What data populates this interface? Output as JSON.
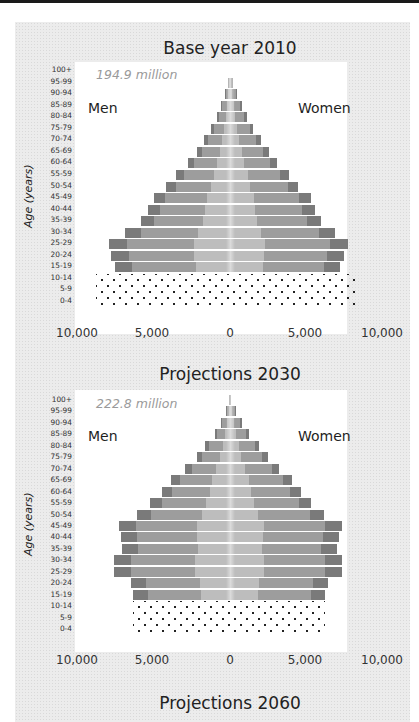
{
  "chart_data": [
    {
      "type": "bar",
      "subtype": "population-pyramid",
      "title": "Base year 2010",
      "annotation": "194.9 million",
      "xlabel": "",
      "ylabel": "Age (years)",
      "xlim": [
        -10000,
        10000
      ],
      "x_tick_labels": [
        "10,000",
        "5,000",
        "0",
        "5,000",
        "10,000"
      ],
      "legend": [
        "Men",
        "Women"
      ],
      "categories": [
        "100+",
        "95-99",
        "90-94",
        "85-89",
        "80-84",
        "75-79",
        "70-74",
        "65-69",
        "60-64",
        "55-59",
        "50-54",
        "45-49",
        "40-44",
        "35-39",
        "30-34",
        "25-29",
        "20-24",
        "15-19",
        "10-14",
        "5-9",
        "0-4"
      ],
      "series": [
        {
          "name": "Men",
          "values": [
            10,
            120,
            320,
            560,
            870,
            1250,
            1700,
            2180,
            2750,
            3550,
            4180,
            5030,
            5370,
            5880,
            6900,
            7960,
            7820,
            7540,
            8800,
            8800,
            8800
          ]
        },
        {
          "name": "Women",
          "values": [
            30,
            190,
            470,
            760,
            1120,
            1500,
            2050,
            2550,
            3100,
            3900,
            4450,
            5320,
            5620,
            6000,
            6880,
            7740,
            7470,
            7250,
            8500,
            8500,
            8500
          ]
        }
      ],
      "note": "Rows 0-14 shown as dotted pattern (projected/estimated); bars shaded in three tones."
    },
    {
      "type": "bar",
      "subtype": "population-pyramid",
      "title": "Projections 2030",
      "annotation": "222.8 million",
      "xlabel": "",
      "ylabel": "Age (years)",
      "xlim": [
        -10000,
        10000
      ],
      "x_tick_labels": [
        "10,000",
        "5,000",
        "0",
        "5,000",
        "10,000"
      ],
      "legend": [
        "Men",
        "Women"
      ],
      "categories": [
        "100+",
        "95-99",
        "90-94",
        "85-89",
        "80-84",
        "75-79",
        "70-74",
        "65-69",
        "60-64",
        "55-59",
        "50-54",
        "45-49",
        "40-44",
        "35-39",
        "30-34",
        "25-29",
        "20-24",
        "15-19",
        "10-14",
        "5-9",
        "0-4"
      ],
      "series": [
        {
          "name": "Men",
          "values": [
            40,
            250,
            600,
            1000,
            1620,
            2150,
            2950,
            3900,
            4500,
            5260,
            6100,
            7300,
            7180,
            7100,
            7600,
            7650,
            6530,
            6400,
            6350,
            6350,
            6350
          ]
        },
        {
          "name": "Women",
          "values": [
            80,
            370,
            800,
            1250,
            1900,
            2500,
            3200,
            4050,
            4650,
            5350,
            6200,
            7350,
            7200,
            7050,
            7400,
            7400,
            6450,
            6250,
            6250,
            6250,
            6250
          ]
        }
      ]
    },
    {
      "type": "bar",
      "subtype": "population-pyramid",
      "title": "Projections 2060",
      "note": "Only title visible (cut off)"
    }
  ],
  "charts": [
    {
      "title": "Base year 2010",
      "total": "194.9 million",
      "men_label": "Men",
      "women_label": "Women",
      "y_axis_title": "Age (years)"
    },
    {
      "title": "Projections 2030",
      "total": "222.8 million",
      "men_label": "Men",
      "women_label": "Women",
      "y_axis_title": "Age (years)"
    },
    {
      "title": "Projections 2060"
    }
  ],
  "age_groups": [
    "100+",
    "95-99",
    "90-94",
    "85-89",
    "80-84",
    "75-79",
    "70-74",
    "65-69",
    "60-64",
    "55-59",
    "50-54",
    "45-49",
    "40-44",
    "35-39",
    "30-34",
    "25-29",
    "20-24",
    "15-19",
    "10-14",
    "5-9",
    "0-4"
  ],
  "x_ticks": [
    "10,000",
    "5,000",
    "0",
    "5,000",
    "10,000"
  ],
  "colors": {
    "light": "#bdbdbd",
    "mid": "#9d9d9d",
    "dark": "#7a7a7a",
    "panel": "#ececec"
  }
}
